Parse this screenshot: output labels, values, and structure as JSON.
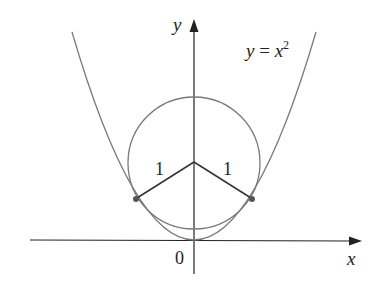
{
  "figure": {
    "type": "diagram",
    "axes": {
      "x_label": "x",
      "y_label": "y",
      "origin_label": "0"
    },
    "curve_label": {
      "lhs": "y",
      "eq": " = ",
      "var": "x",
      "exp": "2"
    },
    "radius_labels": [
      "1",
      "1"
    ],
    "colors": {
      "axes": "#222222",
      "curve": "#7a7a7a",
      "radii": "#333333",
      "points": "#555555"
    }
  }
}
